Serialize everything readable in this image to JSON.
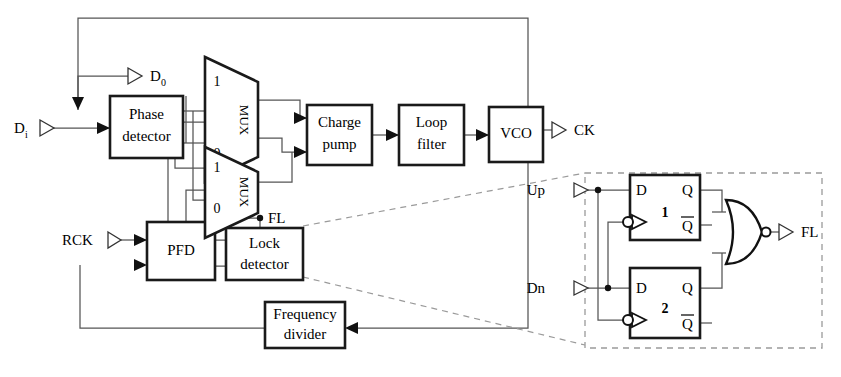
{
  "figure": {
    "type": "block-diagram",
    "line_color": "#555555",
    "block_stroke": "#1a1a1a",
    "dashed_color": "#8a8a8a",
    "background": "#ffffff"
  },
  "blocks": [
    {
      "id": "phase_detector",
      "label_line1": "Phase",
      "label_line2": "detector"
    },
    {
      "id": "charge_pump",
      "label_line1": "Charge",
      "label_line2": "pump"
    },
    {
      "id": "loop_filter",
      "label_line1": "Loop",
      "label_line2": "filter"
    },
    {
      "id": "vco",
      "label_line1": "VCO",
      "label_line2": ""
    },
    {
      "id": "pfd",
      "label_line1": "PFD",
      "label_line2": ""
    },
    {
      "id": "lock_detector",
      "label_line1": "Lock",
      "label_line2": "detector"
    },
    {
      "id": "freq_divider",
      "label_line1": "Frequency",
      "label_line2": "divider"
    }
  ],
  "muxes": [
    {
      "id": "mux_top",
      "label": "MUX",
      "sel_high": "1",
      "sel_low": "0"
    },
    {
      "id": "mux_bottom",
      "label": "MUX",
      "sel_high": "1",
      "sel_low": "0"
    }
  ],
  "ports": {
    "data_in": {
      "base": "D",
      "sub": "i"
    },
    "data_out": {
      "base": "D",
      "sub": "0"
    },
    "ref_clock": "RCK",
    "clock_out": "CK",
    "lock_flag": "FL"
  },
  "inset": {
    "caption": "Lock detector internals",
    "inputs": [
      {
        "id": "up",
        "label": "Up"
      },
      {
        "id": "dn",
        "label": "Dn"
      }
    ],
    "flipflops": [
      {
        "id": "ff1",
        "number": "1",
        "d_pin": "D",
        "q_pin": "Q",
        "qbar_pin": "Q"
      },
      {
        "id": "ff2",
        "number": "2",
        "d_pin": "D",
        "q_pin": "Q",
        "qbar_pin": "Q"
      }
    ],
    "gate": {
      "id": "nor_gate",
      "type": "NOR",
      "inverting": true
    },
    "output": {
      "id": "fl_out",
      "label": "FL"
    }
  }
}
